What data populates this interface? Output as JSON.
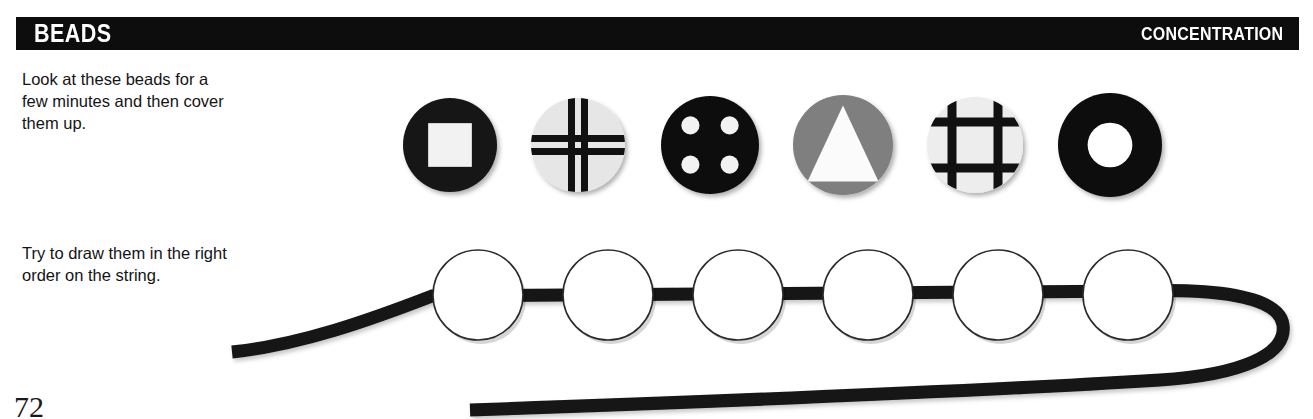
{
  "header": {
    "title": "BEADS",
    "kicker": "CONCENTRATION",
    "background": "#0d0d0d",
    "text_color": "#ffffff"
  },
  "instructions": [
    {
      "id": "look",
      "text": "Look at these beads for a few minutes and then cover them up."
    },
    {
      "id": "draw",
      "text": "Try to draw them in the right order on the string."
    }
  ],
  "beads": [
    {
      "index": 1,
      "name": "black-circle-white-square",
      "body_color": "#141414",
      "motif": "square",
      "motif_color": "#f2f2f2",
      "cx": 450,
      "cy": 145,
      "r": 47
    },
    {
      "index": 2,
      "name": "light-circle-thin-grid",
      "body_color": "#e6e6e6",
      "motif": "grid-thin",
      "motif_color": "#111111",
      "cx": 578,
      "cy": 145,
      "r": 47
    },
    {
      "index": 3,
      "name": "black-circle-four-dots",
      "body_color": "#101010",
      "motif": "four-dots",
      "motif_color": "#f2f2f2",
      "cx": 710,
      "cy": 145,
      "r": 49
    },
    {
      "index": 4,
      "name": "gray-circle-white-triangle",
      "body_color": "#7f7f7f",
      "motif": "triangle",
      "motif_color": "#fbfbfb",
      "cx": 843,
      "cy": 145,
      "r": 50
    },
    {
      "index": 5,
      "name": "light-circle-thick-grid",
      "body_color": "#ededed",
      "motif": "grid-thick",
      "motif_color": "#111111",
      "cx": 975,
      "cy": 145,
      "r": 48
    },
    {
      "index": 6,
      "name": "black-ring",
      "body_color": "#0d0d0d",
      "motif": "ring",
      "motif_color": "#ffffff",
      "cx": 1110,
      "cy": 145,
      "r": 52
    }
  ],
  "string": {
    "name": "bead-string",
    "color": "#141414",
    "thickness": 13,
    "empty_bead_count": 6,
    "empty_bead_radius": 45,
    "empty_bead_fill": "#ffffff",
    "empty_bead_stroke": "#2b2b2b",
    "empty_bead_centers": [
      {
        "cx": 478,
        "cy": 295
      },
      {
        "cx": 608,
        "cy": 295
      },
      {
        "cx": 738,
        "cy": 295
      },
      {
        "cx": 868,
        "cy": 295
      },
      {
        "cx": 998,
        "cy": 295
      },
      {
        "cx": 1128,
        "cy": 295
      }
    ]
  },
  "footer": {
    "page_number": "72"
  }
}
